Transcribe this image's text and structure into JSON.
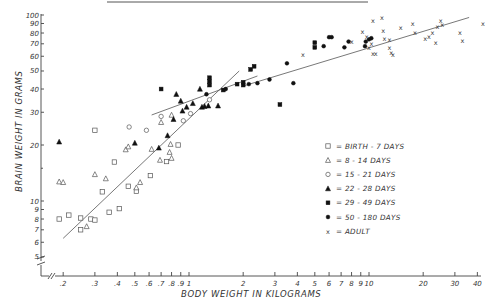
{
  "chart_data": {
    "type": "scatter",
    "title": "",
    "xlabel": "BODY WEIGHT IN KILOGRAMS",
    "ylabel": "BRAIN WEIGHT IN GRAMS",
    "xscale": "log",
    "yscale": "log",
    "xlim": [
      0.18,
      42
    ],
    "ylim": [
      4.7,
      100
    ],
    "x_ticks": [
      ".2",
      ".3",
      ".4",
      ".5",
      ".6",
      ".7",
      ".8",
      ".9",
      "1",
      "2",
      "3",
      "4",
      "5",
      "6",
      "7",
      "8",
      "9",
      "10",
      "20",
      "30",
      "40"
    ],
    "x_tick_values": [
      0.2,
      0.3,
      0.4,
      0.5,
      0.6,
      0.7,
      0.8,
      0.9,
      1,
      2,
      3,
      4,
      5,
      6,
      7,
      8,
      9,
      10,
      20,
      30,
      40
    ],
    "y_ticks": [
      "5",
      "6",
      "7",
      "8",
      "9",
      "10",
      "20",
      "30",
      "40",
      "50",
      "60",
      "70",
      "80",
      "90",
      "100"
    ],
    "y_tick_values": [
      5,
      6,
      7,
      8,
      9,
      10,
      20,
      30,
      40,
      50,
      60,
      70,
      80,
      90,
      100
    ],
    "axis_breaks": true,
    "grid": false,
    "legend_position": "right-center",
    "legend": [
      {
        "marker": "hollow-square",
        "label": "= BIRTH - 7 DAYS"
      },
      {
        "marker": "hollow-triangle",
        "label": "= 8 - 14 DAYS"
      },
      {
        "marker": "hollow-circle",
        "label": "= 15 - 21 DAYS"
      },
      {
        "marker": "solid-triangle",
        "label": "= 22-28 DAYS"
      },
      {
        "marker": "solid-square",
        "label": "= 29-49 DAYS"
      },
      {
        "marker": "solid-circle",
        "label": "= 50 -180 DAYS"
      },
      {
        "marker": "x",
        "label": "= ADULT"
      }
    ],
    "series": [
      {
        "name": "BIRTH - 7 DAYS",
        "marker": "hollow-square",
        "points": [
          [
            0.19,
            8.0
          ],
          [
            0.215,
            8.4
          ],
          [
            0.25,
            8.1
          ],
          [
            0.25,
            7.0
          ],
          [
            0.285,
            8.0
          ],
          [
            0.3,
            7.9
          ],
          [
            0.33,
            11.2
          ],
          [
            0.36,
            8.7
          ],
          [
            0.385,
            16.2
          ],
          [
            0.41,
            9.1
          ],
          [
            0.46,
            12.0
          ],
          [
            0.51,
            11.3
          ],
          [
            0.61,
            13.7
          ],
          [
            0.75,
            16.3
          ],
          [
            0.87,
            20.0
          ],
          [
            0.3,
            24.0
          ]
        ]
      },
      {
        "name": "8 - 14 DAYS",
        "marker": "hollow-triangle",
        "points": [
          [
            0.19,
            12.7
          ],
          [
            0.2,
            12.6
          ],
          [
            0.27,
            7.3
          ],
          [
            0.3,
            13.9
          ],
          [
            0.345,
            13.2
          ],
          [
            0.445,
            18.9
          ],
          [
            0.46,
            19.6
          ],
          [
            0.51,
            11.8
          ],
          [
            0.535,
            12.6
          ],
          [
            0.62,
            19.0
          ],
          [
            0.69,
            16.6
          ],
          [
            0.79,
            20.2
          ],
          [
            0.78,
            18.3
          ],
          [
            0.8,
            17.0
          ],
          [
            0.7,
            26.5
          ],
          [
            0.8,
            29.0
          ]
        ]
      },
      {
        "name": "15 - 21 DAYS",
        "marker": "hollow-circle",
        "points": [
          [
            0.465,
            25.0
          ],
          [
            0.58,
            24.0
          ],
          [
            0.7,
            28.5
          ],
          [
            0.93,
            27.0
          ],
          [
            1.02,
            29.5
          ],
          [
            1.3,
            35.0
          ]
        ]
      },
      {
        "name": "22-28 DAYS",
        "marker": "solid-triangle",
        "points": [
          [
            0.19,
            20.8
          ],
          [
            0.5,
            20.5
          ],
          [
            0.68,
            19.3
          ],
          [
            0.76,
            22.5
          ],
          [
            0.82,
            27.5
          ],
          [
            0.85,
            37.5
          ],
          [
            0.9,
            34.5
          ],
          [
            0.92,
            30.5
          ],
          [
            0.97,
            32.0
          ],
          [
            1.05,
            33.5
          ],
          [
            1.15,
            40.0
          ],
          [
            1.18,
            32.0
          ],
          [
            1.22,
            32.3
          ],
          [
            1.28,
            32.5
          ],
          [
            1.45,
            32.5
          ]
        ]
      },
      {
        "name": "29-49 DAYS",
        "marker": "solid-square",
        "points": [
          [
            0.7,
            40.0
          ],
          [
            1.3,
            42.0
          ],
          [
            1.3,
            44.0
          ],
          [
            1.3,
            46.0
          ],
          [
            1.55,
            39.5
          ],
          [
            1.85,
            42.5
          ],
          [
            2.0,
            42.0
          ],
          [
            2.2,
            51.0
          ],
          [
            2.3,
            53.0
          ],
          [
            2.0,
            43.5
          ],
          [
            3.2,
            33.0
          ],
          [
            5.0,
            67.0
          ],
          [
            5.0,
            71.0
          ]
        ]
      },
      {
        "name": "50 -180 DAYS",
        "marker": "solid-circle",
        "points": [
          [
            1.25,
            37.5
          ],
          [
            1.6,
            40.0
          ],
          [
            2.15,
            42.5
          ],
          [
            2.4,
            43.0
          ],
          [
            2.8,
            45.0
          ],
          [
            3.5,
            55.0
          ],
          [
            3.8,
            43.0
          ],
          [
            5.6,
            68.0
          ],
          [
            6.0,
            76.0
          ],
          [
            6.2,
            76.0
          ],
          [
            7.3,
            67.0
          ],
          [
            7.7,
            72.0
          ],
          [
            9.5,
            68.0
          ],
          [
            9.6,
            72.0
          ],
          [
            10.0,
            74.0
          ],
          [
            10.3,
            75.0
          ]
        ]
      },
      {
        "name": "ADULT",
        "marker": "x",
        "points": [
          [
            4.3,
            61.0
          ],
          [
            8.0,
            72.0
          ],
          [
            9.2,
            81.0
          ],
          [
            9.7,
            76.0
          ],
          [
            10.0,
            67.0
          ],
          [
            10.3,
            70.0
          ],
          [
            10.5,
            62.0
          ],
          [
            10.9,
            62.0
          ],
          [
            10.5,
            93.0
          ],
          [
            11.8,
            97.0
          ],
          [
            12.0,
            82.0
          ],
          [
            12.2,
            75.0
          ],
          [
            13.0,
            67.0
          ],
          [
            13.3,
            63.0
          ],
          [
            13.6,
            61.0
          ],
          [
            13.0,
            74.0
          ],
          [
            15.0,
            85.0
          ],
          [
            18.0,
            80.0
          ],
          [
            17.5,
            90.0
          ],
          [
            20.5,
            75.0
          ],
          [
            21.5,
            76.0
          ],
          [
            22.5,
            80.0
          ],
          [
            23.5,
            71.0
          ],
          [
            24.0,
            87.0
          ],
          [
            25.0,
            93.0
          ],
          [
            25.5,
            89.0
          ],
          [
            32.0,
            80.0
          ],
          [
            33.0,
            73.0
          ],
          [
            43.0,
            90.0
          ]
        ]
      }
    ],
    "fit_lines": [
      {
        "name": "juvenile regression",
        "from": [
          0.2,
          6.3
        ],
        "to": [
          1.9,
          50.0
        ]
      },
      {
        "name": "older regression",
        "from": [
          0.62,
          29.0
        ],
        "to": [
          2.4,
          47.0
        ]
      },
      {
        "name": "adult regression",
        "from": [
          2.0,
          41.5
        ],
        "to": [
          36.0,
          97.0
        ]
      }
    ]
  },
  "text": {
    "ylabel": "BRAIN WEIGHT IN GRAMS",
    "xlabel": "BODY WEIGHT IN KILOGRAMS",
    "legend": [
      "= BIRTH  - 7 DAYS",
      "= 8  - 14  DAYS",
      "= 15 - 21  DAYS",
      "= 22 - 28  DAYS",
      "= 29 - 49  DAYS",
      "= 50 - 180  DAYS",
      "= ADULT"
    ]
  }
}
